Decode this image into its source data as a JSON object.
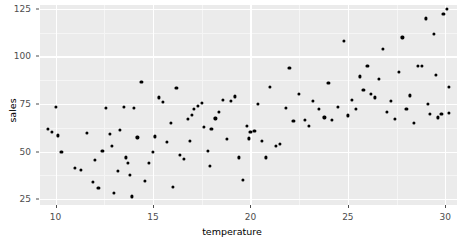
{
  "chart_data": {
    "type": "scatter",
    "title": "",
    "xlabel": "temperature",
    "ylabel": "sales",
    "xlim": [
      9.2,
      30.6
    ],
    "ylim": [
      22.0,
      127.0
    ],
    "grid": true,
    "legend": null,
    "x_ticks": [
      10,
      15,
      20,
      25,
      30
    ],
    "y_ticks": [
      25,
      50,
      75,
      100,
      125
    ],
    "x_minor_ticks": [
      12.5,
      17.5,
      22.5,
      27.5
    ],
    "y_minor_ticks": [
      37.5,
      62.5,
      87.5,
      112.5
    ],
    "marker": {
      "shape": "circle",
      "color": "#000000",
      "size": 3.2
    },
    "panel_background": "#ebebeb",
    "gridline_color": "#ffffff",
    "points": [
      [
        9.6,
        62.0
      ],
      [
        9.8,
        60.5
      ],
      [
        10.0,
        73.5
      ],
      [
        10.1,
        58.5
      ],
      [
        10.3,
        50.0
      ],
      [
        11.0,
        41.5
      ],
      [
        11.3,
        40.5
      ],
      [
        11.6,
        60.0
      ],
      [
        11.9,
        34.0
      ],
      [
        12.0,
        45.5
      ],
      [
        12.2,
        31.0
      ],
      [
        12.4,
        50.5
      ],
      [
        12.6,
        73.0
      ],
      [
        12.8,
        59.5
      ],
      [
        13.0,
        28.5
      ],
      [
        13.2,
        40.0
      ],
      [
        13.3,
        61.5
      ],
      [
        13.5,
        73.5
      ],
      [
        13.6,
        47.0
      ],
      [
        13.7,
        44.0
      ],
      [
        13.8,
        38.0
      ],
      [
        13.9,
        26.5
      ],
      [
        14.0,
        73.0
      ],
      [
        14.2,
        57.5
      ],
      [
        14.4,
        86.5
      ],
      [
        14.6,
        34.5
      ],
      [
        14.8,
        44.0
      ],
      [
        15.0,
        50.0
      ],
      [
        15.1,
        58.0
      ],
      [
        15.3,
        78.5
      ],
      [
        15.5,
        76.0
      ],
      [
        15.7,
        55.0
      ],
      [
        15.9,
        65.0
      ],
      [
        16.0,
        31.5
      ],
      [
        16.2,
        83.5
      ],
      [
        16.4,
        48.5
      ],
      [
        16.6,
        46.0
      ],
      [
        16.8,
        67.0
      ],
      [
        17.0,
        69.5
      ],
      [
        17.1,
        72.5
      ],
      [
        17.3,
        74.0
      ],
      [
        17.5,
        75.5
      ],
      [
        17.6,
        63.0
      ],
      [
        17.8,
        50.5
      ],
      [
        17.9,
        42.5
      ],
      [
        18.0,
        62.0
      ],
      [
        18.2,
        67.5
      ],
      [
        18.4,
        71.0
      ],
      [
        18.6,
        77.0
      ],
      [
        18.8,
        56.5
      ],
      [
        19.0,
        76.5
      ],
      [
        19.2,
        79.0
      ],
      [
        19.4,
        47.0
      ],
      [
        19.6,
        35.0
      ],
      [
        19.8,
        63.5
      ],
      [
        20.0,
        60.5
      ],
      [
        20.2,
        61.0
      ],
      [
        20.4,
        75.0
      ],
      [
        20.6,
        55.5
      ],
      [
        20.8,
        47.0
      ],
      [
        21.0,
        84.0
      ],
      [
        21.3,
        53.0
      ],
      [
        21.5,
        54.0
      ],
      [
        21.8,
        73.0
      ],
      [
        22.0,
        94.0
      ],
      [
        22.2,
        66.0
      ],
      [
        22.5,
        80.5
      ],
      [
        22.8,
        66.5
      ],
      [
        23.0,
        63.5
      ],
      [
        23.2,
        76.5
      ],
      [
        23.5,
        72.5
      ],
      [
        23.8,
        68.0
      ],
      [
        24.0,
        86.0
      ],
      [
        24.2,
        66.5
      ],
      [
        24.5,
        73.5
      ],
      [
        24.8,
        108.0
      ],
      [
        25.0,
        69.0
      ],
      [
        25.2,
        77.0
      ],
      [
        25.4,
        72.5
      ],
      [
        25.6,
        89.5
      ],
      [
        25.8,
        82.5
      ],
      [
        26.0,
        95.0
      ],
      [
        26.2,
        80.5
      ],
      [
        26.4,
        78.5
      ],
      [
        26.6,
        88.0
      ],
      [
        26.8,
        104.0
      ],
      [
        27.0,
        71.0
      ],
      [
        27.2,
        76.5
      ],
      [
        27.4,
        67.0
      ],
      [
        27.6,
        92.0
      ],
      [
        27.8,
        110.0
      ],
      [
        28.0,
        72.5
      ],
      [
        28.2,
        79.5
      ],
      [
        28.4,
        65.0
      ],
      [
        28.6,
        95.0
      ],
      [
        28.8,
        95.0
      ],
      [
        29.0,
        120.0
      ],
      [
        29.1,
        75.0
      ],
      [
        29.2,
        70.0
      ],
      [
        29.4,
        112.0
      ],
      [
        29.5,
        90.5
      ],
      [
        29.6,
        68.0
      ],
      [
        29.8,
        70.0
      ],
      [
        29.9,
        122.5
      ],
      [
        30.1,
        125.0
      ],
      [
        30.2,
        84.0
      ],
      [
        30.2,
        70.5
      ],
      [
        19.9,
        57.0
      ],
      [
        16.9,
        55.5
      ],
      [
        12.9,
        53.0
      ]
    ]
  }
}
